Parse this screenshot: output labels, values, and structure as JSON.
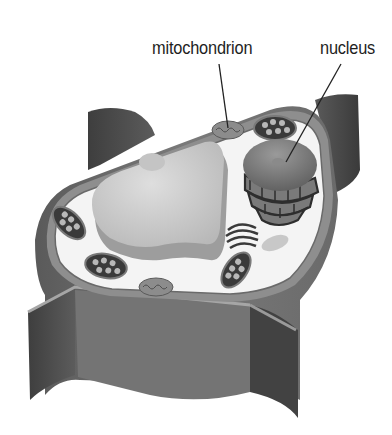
{
  "diagram": {
    "labels": [
      {
        "id": "mitochondrion",
        "text": "mitochondrion",
        "points_to": "mitochondrion near top of cytoplasm"
      },
      {
        "id": "nucleus",
        "text": "nucleus",
        "points_to": "nucleolus inside nucleus"
      }
    ],
    "unlabeled_structures": [
      "cell wall",
      "cell membrane",
      "central vacuole",
      "chloroplast",
      "chloroplast",
      "chloroplast",
      "chloroplast",
      "chloroplast",
      "mitochondrion",
      "rough endoplasmic reticulum",
      "golgi apparatus",
      "vesicle",
      "vesicle"
    ],
    "colors": {
      "background": "#ffffff",
      "wall_dark": "#4a4a4a",
      "wall_mid": "#6e6e6e",
      "cytoplasm": "#f2f2f2",
      "vacuole": "#c9c9c9",
      "label_text": "#1e1e1e"
    }
  }
}
